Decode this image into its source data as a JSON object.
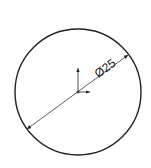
{
  "drawing": {
    "dimension_label": "Ø25",
    "circle": {
      "cx": 78,
      "cy": 92,
      "r": 63
    },
    "colors": {
      "stroke": "#222222",
      "background": "#ffffff"
    }
  }
}
